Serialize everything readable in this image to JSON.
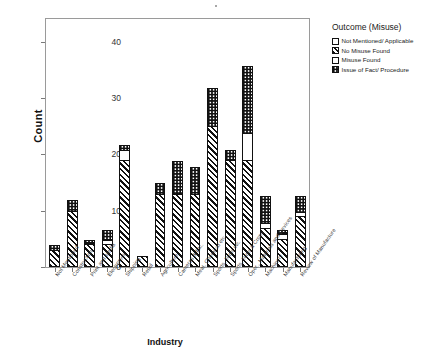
{
  "chart_data": {
    "type": "bar",
    "subtype": "stacked-bar",
    "title": "",
    "xlabel": "Industry",
    "ylabel": "Count",
    "ylim": [
      0,
      44
    ],
    "yticks": [
      0,
      10,
      20,
      30,
      40
    ],
    "ytick_labels": [
      "0",
      "10",
      "20",
      "30",
      "40"
    ],
    "grid": false,
    "legend_position": "right",
    "legend_title": "Outcome (Misuse)",
    "categories": [
      "Not Mentioned",
      "Construction",
      "Print and Media",
      "Electronics",
      "Shipping",
      "Retail",
      "Agriculture",
      "Cameras & Etc.",
      "Meat, Chemical etc.",
      "Sports, Tools etc.",
      "Sports, Tools & Crops",
      "Oper., Materials and Devices",
      "Machinery",
      "Manufacturing",
      "Review of Manufacture"
    ],
    "series": [
      {
        "name": "Not Mentioned/ Applicable",
        "pattern": "none",
        "values": [
          0,
          0,
          0,
          0,
          0,
          0,
          0,
          0,
          0,
          0,
          0,
          0,
          0,
          0,
          0
        ]
      },
      {
        "name": "No Misuse Found",
        "pattern": "diagonal-hatch",
        "values": [
          3,
          10,
          4,
          4,
          19,
          2,
          13,
          13,
          13,
          25,
          19,
          19,
          7,
          5,
          9
        ]
      },
      {
        "name": "Misuse Found",
        "pattern": "open",
        "values": [
          0,
          0,
          0,
          1,
          2,
          0,
          0,
          0,
          0,
          0,
          0,
          5,
          1,
          1,
          1
        ]
      },
      {
        "name": "Issue of Fact/ Procedure",
        "pattern": "checker",
        "values": [
          1,
          2,
          1,
          2,
          1,
          0,
          2,
          6,
          5,
          7,
          2,
          12,
          5,
          1,
          3
        ]
      }
    ],
    "bar_totals": [
      4,
      12,
      5,
      7,
      22,
      2,
      15,
      19,
      18,
      32,
      21,
      36,
      13,
      7,
      13
    ]
  },
  "legend": {
    "title": "Outcome (Misuse)",
    "items": [
      {
        "label": "Not Mentioned/ Applicable",
        "pattern": "none"
      },
      {
        "label": "No Misuse Found",
        "pattern": "diagonal-hatch"
      },
      {
        "label": "Misuse Found",
        "pattern": "open"
      },
      {
        "label": "Issue of Fact/ Procedure",
        "pattern": "checker"
      }
    ]
  },
  "axes": {
    "y_title": "Count",
    "x_title": "Industry"
  }
}
